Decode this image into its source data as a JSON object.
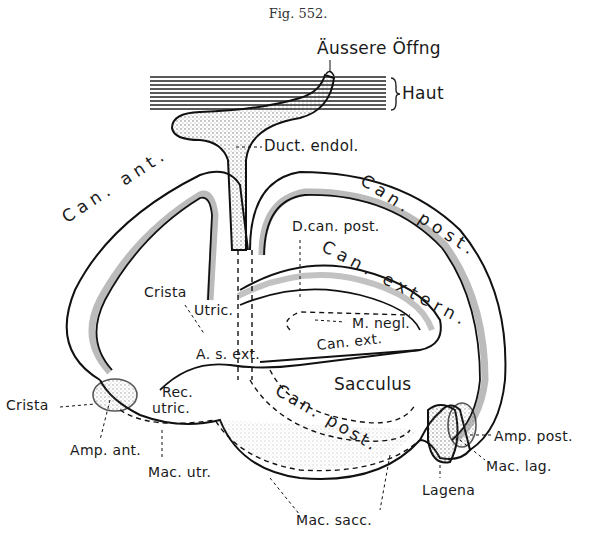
{
  "figure": {
    "caption": "Fig. 552."
  },
  "labels": {
    "aussere_offnung": "Äussere Öffng",
    "haut": "Haut",
    "duct_endol": "Duct. endol.",
    "can_ant": "Can. ant.",
    "can_post_top": "Can. post.",
    "d_can_post": "D.can. post.",
    "can_extern": "Can. extern.",
    "crista_top": "Crista",
    "ultric": "Utric.",
    "a_s_ext": "A. s. ext.",
    "m_negl": "M. negl.",
    "can_ext": "Can. ext.",
    "sacculus": "Sacculus",
    "crista_left": "Crista",
    "rec_utric_1": "Rec.",
    "rec_utric_2": "utric.",
    "can_post_lower": "Can. post.",
    "amp_ant": "Amp. ant.",
    "mac_utr": "Mac. utr.",
    "amp_post": "Amp. post.",
    "mac_lag": "Mac. lag.",
    "lagena": "Lagena",
    "mac_sacc": "Mac. sacc."
  },
  "colors": {
    "ink": "#1a1a1a",
    "stipple": "#777777",
    "paper": "#ffffff"
  }
}
